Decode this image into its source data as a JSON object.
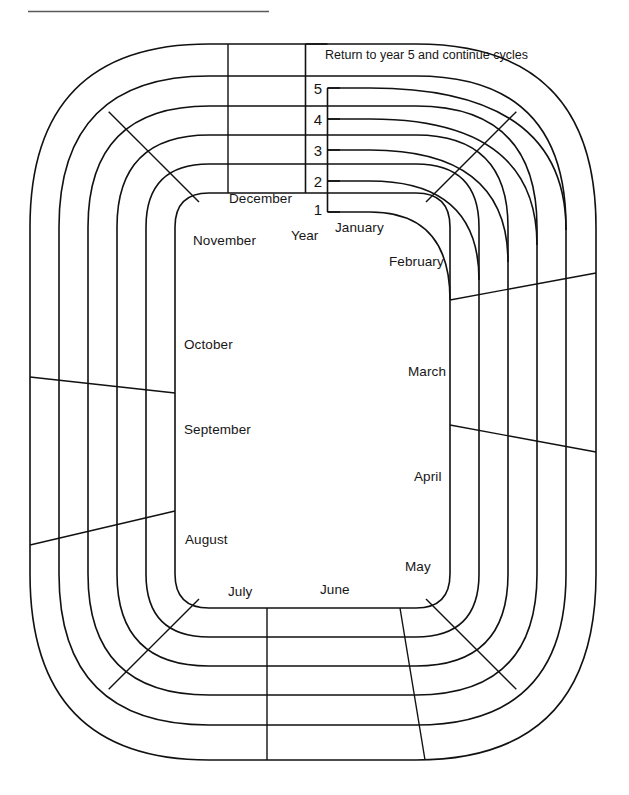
{
  "diagram": {
    "title_rule": "",
    "note": {
      "text": "Return to year 5 and continue cycles"
    },
    "year_axis": {
      "label": "Year",
      "ticks": [
        "5",
        "4",
        "3",
        "2",
        "1"
      ]
    },
    "months": [
      {
        "name": "January",
        "x": 335,
        "y": 228
      },
      {
        "name": "February",
        "x": 389,
        "y": 262
      },
      {
        "name": "March",
        "x": 408,
        "y": 372
      },
      {
        "name": "April",
        "x": 414,
        "y": 477
      },
      {
        "name": "May",
        "x": 405,
        "y": 567
      },
      {
        "name": "June",
        "x": 320,
        "y": 590
      },
      {
        "name": "July",
        "x": 228,
        "y": 592
      },
      {
        "name": "August",
        "x": 185,
        "y": 540
      },
      {
        "name": "September",
        "x": 184,
        "y": 430
      },
      {
        "name": "October",
        "x": 184,
        "y": 345
      },
      {
        "name": "November",
        "x": 193,
        "y": 241
      },
      {
        "name": "December",
        "x": 229,
        "y": 199
      }
    ],
    "colors": {
      "ink": "#111111",
      "paper": "#ffffff",
      "rule": "#5a5a5a"
    },
    "geometry": {
      "ring_count": 6,
      "ring_labels_count": 5,
      "month_count": 12
    }
  }
}
